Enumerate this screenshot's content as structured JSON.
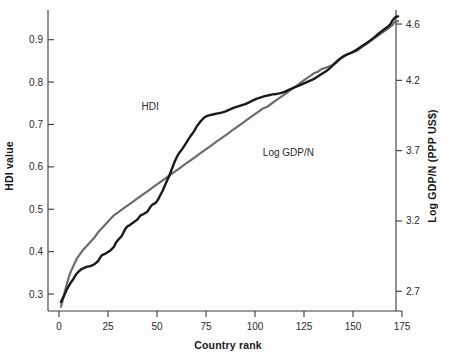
{
  "chart_data": {
    "type": "line",
    "title": "",
    "subtitle": "",
    "xlabel": "Country rank",
    "ylabel": "HDI value",
    "y2label": "Log GDP/N (PPP US$)",
    "xlim": [
      0,
      175
    ],
    "ylim": [
      0.26,
      0.97
    ],
    "y2lim": [
      2.56,
      4.7
    ],
    "grid": false,
    "legend_position": "inline-annotations",
    "xticks": [
      0,
      25,
      50,
      75,
      100,
      125,
      150,
      175
    ],
    "xtick_labels": [
      "0",
      "25",
      "50",
      "75",
      "100",
      "125",
      "150",
      "175"
    ],
    "yticks": [
      0.3,
      0.4,
      0.5,
      0.6,
      0.7,
      0.8,
      0.9
    ],
    "ytick_labels": [
      "0.3",
      "0.4",
      "0.5",
      "0.6",
      "0.7",
      "0.8",
      "0.9"
    ],
    "y2ticks": [
      2.7,
      3.2,
      3.7,
      4.2,
      4.6
    ],
    "y2tick_labels": [
      "2.7",
      "3.2",
      "3.7",
      "4.2",
      "4.6"
    ],
    "x": [
      1,
      3,
      5,
      7,
      9,
      11,
      13,
      15,
      17,
      19,
      21,
      23,
      25,
      27,
      29,
      31,
      33,
      35,
      37,
      39,
      41,
      43,
      45,
      47,
      49,
      51,
      53,
      55,
      57,
      59,
      61,
      63,
      65,
      67,
      69,
      71,
      73,
      75,
      77,
      79,
      81,
      83,
      85,
      87,
      89,
      91,
      93,
      95,
      97,
      99,
      101,
      103,
      105,
      107,
      109,
      111,
      113,
      115,
      117,
      119,
      121,
      123,
      125,
      127,
      129,
      131,
      133,
      135,
      137,
      139,
      141,
      143,
      145,
      147,
      149,
      151,
      153,
      155,
      157,
      159,
      161,
      163,
      165,
      167,
      169,
      171,
      173
    ],
    "series": [
      {
        "name": "HDI",
        "axis": "left",
        "color": "#1a1a1a",
        "label_x": 58,
        "label_y": 0.735,
        "values": [
          0.281,
          0.298,
          0.312,
          0.327,
          0.339,
          0.352,
          0.361,
          0.369,
          0.374,
          0.381,
          0.389,
          0.398,
          0.404,
          0.412,
          0.421,
          0.43,
          0.441,
          0.452,
          0.463,
          0.472,
          0.479,
          0.486,
          0.492,
          0.497,
          0.503,
          0.509,
          0.513,
          0.517,
          0.52,
          0.524,
          0.528,
          0.532,
          0.536,
          0.541,
          0.546,
          0.552,
          0.559,
          0.566,
          0.574,
          0.583,
          0.592,
          0.601,
          0.611,
          0.621,
          0.632,
          0.643,
          0.653,
          0.663,
          0.672,
          0.681,
          0.689,
          0.696,
          0.702,
          0.708,
          0.713,
          0.718,
          0.722,
          0.726,
          0.73,
          0.733,
          0.736,
          0.739,
          0.742,
          0.745,
          0.748,
          0.751,
          0.754,
          0.757,
          0.76,
          0.763,
          0.766,
          0.769,
          0.772,
          0.775,
          0.778,
          0.781,
          0.784,
          0.787,
          0.791,
          0.795,
          0.799,
          0.803,
          0.808,
          0.813,
          0.818,
          0.823,
          0.828
        ]
      },
      {
        "name": "Log GDP/N",
        "axis": "right",
        "color": "#6c6c6c",
        "label_x": 104,
        "label_y": 3.69,
        "values": [
          2.62,
          2.66,
          2.7,
          2.74,
          2.77,
          2.8,
          2.83,
          2.86,
          2.88,
          2.91,
          2.93,
          2.96,
          2.98,
          3.0,
          3.03,
          3.05,
          3.08,
          3.1,
          3.13,
          3.15,
          3.17,
          3.19,
          3.21,
          3.23,
          3.25,
          3.27,
          3.29,
          3.3,
          3.32,
          3.34,
          3.36,
          3.38,
          3.4,
          3.42,
          3.44,
          3.46,
          3.48,
          3.5,
          3.52,
          3.54,
          3.56,
          3.58,
          3.6,
          3.62,
          3.64,
          3.66,
          3.68,
          3.7,
          3.72,
          3.74,
          3.76,
          3.78,
          3.8,
          3.82,
          3.84,
          3.86,
          3.88,
          3.9,
          3.92,
          3.94,
          3.96,
          3.98,
          4.0,
          4.02,
          4.04,
          4.06,
          4.08,
          4.1,
          4.12,
          4.14,
          4.16,
          4.18,
          4.2,
          4.22,
          4.24,
          4.26,
          4.28,
          4.3,
          4.33,
          4.36,
          4.39,
          4.42,
          4.46,
          4.5,
          4.54,
          4.58,
          4.61
        ]
      }
    ],
    "hdi_curve_points": [
      [
        1,
        0.281
      ],
      [
        2,
        0.291
      ],
      [
        3,
        0.3
      ],
      [
        4,
        0.311
      ],
      [
        5,
        0.319
      ],
      [
        6,
        0.327
      ],
      [
        7,
        0.333
      ],
      [
        8,
        0.341
      ],
      [
        9,
        0.348
      ],
      [
        10,
        0.353
      ],
      [
        11,
        0.357
      ],
      [
        12,
        0.36
      ],
      [
        14,
        0.364
      ],
      [
        16,
        0.366
      ],
      [
        18,
        0.37
      ],
      [
        20,
        0.378
      ],
      [
        21,
        0.386
      ],
      [
        22,
        0.392
      ],
      [
        24,
        0.396
      ],
      [
        26,
        0.402
      ],
      [
        28,
        0.411
      ],
      [
        29,
        0.421
      ],
      [
        30,
        0.427
      ],
      [
        31,
        0.432
      ],
      [
        32,
        0.437
      ],
      [
        33,
        0.446
      ],
      [
        34,
        0.455
      ],
      [
        35,
        0.46
      ],
      [
        36,
        0.462
      ],
      [
        37,
        0.466
      ],
      [
        38,
        0.469
      ],
      [
        40,
        0.476
      ],
      [
        41,
        0.482
      ],
      [
        42,
        0.487
      ],
      [
        43,
        0.488
      ],
      [
        44,
        0.491
      ],
      [
        45,
        0.494
      ],
      [
        46,
        0.501
      ],
      [
        47,
        0.508
      ],
      [
        48,
        0.512
      ],
      [
        49,
        0.514
      ],
      [
        50,
        0.519
      ],
      [
        51,
        0.527
      ],
      [
        52,
        0.536
      ],
      [
        53,
        0.545
      ],
      [
        54,
        0.556
      ],
      [
        55,
        0.566
      ],
      [
        56,
        0.576
      ],
      [
        57,
        0.588
      ],
      [
        58,
        0.6
      ],
      [
        59,
        0.612
      ],
      [
        60,
        0.622
      ],
      [
        61,
        0.631
      ],
      [
        62,
        0.637
      ],
      [
        63,
        0.643
      ],
      [
        64,
        0.65
      ],
      [
        65,
        0.657
      ],
      [
        66,
        0.665
      ],
      [
        67,
        0.672
      ],
      [
        68,
        0.678
      ],
      [
        69,
        0.685
      ],
      [
        70,
        0.693
      ],
      [
        71,
        0.7
      ],
      [
        72,
        0.706
      ],
      [
        73,
        0.711
      ],
      [
        74,
        0.716
      ],
      [
        75,
        0.719
      ],
      [
        77,
        0.722
      ],
      [
        79,
        0.724
      ],
      [
        81,
        0.726
      ],
      [
        83,
        0.728
      ],
      [
        85,
        0.731
      ],
      [
        87,
        0.735
      ],
      [
        89,
        0.739
      ],
      [
        91,
        0.742
      ],
      [
        93,
        0.745
      ],
      [
        95,
        0.748
      ],
      [
        97,
        0.752
      ],
      [
        99,
        0.757
      ],
      [
        101,
        0.761
      ],
      [
        103,
        0.764
      ],
      [
        105,
        0.767
      ],
      [
        107,
        0.769
      ],
      [
        109,
        0.771
      ],
      [
        111,
        0.772
      ],
      [
        113,
        0.774
      ],
      [
        115,
        0.777
      ],
      [
        117,
        0.781
      ],
      [
        119,
        0.785
      ],
      [
        121,
        0.789
      ],
      [
        123,
        0.793
      ],
      [
        125,
        0.797
      ],
      [
        127,
        0.801
      ],
      [
        129,
        0.805
      ],
      [
        131,
        0.81
      ],
      [
        133,
        0.816
      ],
      [
        135,
        0.822
      ],
      [
        137,
        0.828
      ],
      [
        139,
        0.836
      ],
      [
        141,
        0.846
      ],
      [
        143,
        0.854
      ],
      [
        145,
        0.86
      ],
      [
        147,
        0.865
      ],
      [
        149,
        0.869
      ],
      [
        151,
        0.874
      ],
      [
        153,
        0.88
      ],
      [
        155,
        0.886
      ],
      [
        157,
        0.892
      ],
      [
        159,
        0.899
      ],
      [
        161,
        0.906
      ],
      [
        163,
        0.914
      ],
      [
        165,
        0.921
      ],
      [
        167,
        0.928
      ],
      [
        169,
        0.936
      ],
      [
        170,
        0.944
      ],
      [
        171,
        0.95
      ],
      [
        172,
        0.954
      ],
      [
        173,
        0.955
      ]
    ],
    "gdp_curve_points": [
      [
        1,
        2.59
      ],
      [
        2,
        2.64
      ],
      [
        3,
        2.7
      ],
      [
        4,
        2.75
      ],
      [
        5,
        2.8
      ],
      [
        6,
        2.84
      ],
      [
        7,
        2.87
      ],
      [
        8,
        2.9
      ],
      [
        9,
        2.93
      ],
      [
        10,
        2.95
      ],
      [
        11,
        2.97
      ],
      [
        12,
        2.99
      ],
      [
        14,
        3.02
      ],
      [
        16,
        3.05
      ],
      [
        18,
        3.08
      ],
      [
        20,
        3.12
      ],
      [
        22,
        3.15
      ],
      [
        24,
        3.18
      ],
      [
        26,
        3.21
      ],
      [
        28,
        3.24
      ],
      [
        30,
        3.26
      ],
      [
        32,
        3.28
      ],
      [
        34,
        3.3
      ],
      [
        36,
        3.32
      ],
      [
        38,
        3.34
      ],
      [
        40,
        3.36
      ],
      [
        42,
        3.38
      ],
      [
        44,
        3.4
      ],
      [
        46,
        3.42
      ],
      [
        48,
        3.44
      ],
      [
        50,
        3.46
      ],
      [
        52,
        3.48
      ],
      [
        54,
        3.5
      ],
      [
        56,
        3.52
      ],
      [
        58,
        3.54
      ],
      [
        60,
        3.56
      ],
      [
        62,
        3.58
      ],
      [
        64,
        3.6
      ],
      [
        66,
        3.62
      ],
      [
        68,
        3.64
      ],
      [
        70,
        3.66
      ],
      [
        72,
        3.68
      ],
      [
        74,
        3.7
      ],
      [
        76,
        3.72
      ],
      [
        78,
        3.74
      ],
      [
        80,
        3.76
      ],
      [
        82,
        3.78
      ],
      [
        84,
        3.8
      ],
      [
        86,
        3.82
      ],
      [
        88,
        3.84
      ],
      [
        90,
        3.86
      ],
      [
        92,
        3.88
      ],
      [
        94,
        3.9
      ],
      [
        96,
        3.92
      ],
      [
        98,
        3.94
      ],
      [
        100,
        3.96
      ],
      [
        102,
        3.98
      ],
      [
        104,
        4.0
      ],
      [
        106,
        4.01
      ],
      [
        108,
        4.03
      ],
      [
        110,
        4.05
      ],
      [
        112,
        4.07
      ],
      [
        114,
        4.09
      ],
      [
        116,
        4.11
      ],
      [
        118,
        4.13
      ],
      [
        120,
        4.15
      ],
      [
        122,
        4.17
      ],
      [
        124,
        4.19
      ],
      [
        126,
        4.21
      ],
      [
        128,
        4.23
      ],
      [
        130,
        4.25
      ],
      [
        132,
        4.26
      ],
      [
        134,
        4.28
      ],
      [
        136,
        4.29
      ],
      [
        138,
        4.3
      ],
      [
        140,
        4.31
      ],
      [
        142,
        4.33
      ],
      [
        144,
        4.36
      ],
      [
        146,
        4.38
      ],
      [
        148,
        4.39
      ],
      [
        150,
        4.4
      ],
      [
        152,
        4.41
      ],
      [
        154,
        4.43
      ],
      [
        156,
        4.45
      ],
      [
        158,
        4.47
      ],
      [
        160,
        4.49
      ],
      [
        162,
        4.51
      ],
      [
        164,
        4.53
      ],
      [
        166,
        4.55
      ],
      [
        168,
        4.57
      ],
      [
        170,
        4.59
      ],
      [
        171,
        4.61
      ],
      [
        172,
        4.62
      ],
      [
        173,
        4.62
      ]
    ]
  },
  "axes": {
    "left_title": "HDI value",
    "right_title": "Log GDP/N (PPP US$)",
    "bottom_title": "Country rank"
  },
  "annotations": {
    "hdi_label": "HDI",
    "gdp_label": "Log GDP/N"
  },
  "colors": {
    "hdi": "#1a1a1a",
    "gdp": "#6c6c6c",
    "axis": "#3a3a3a",
    "background": "#fdfdfd"
  }
}
